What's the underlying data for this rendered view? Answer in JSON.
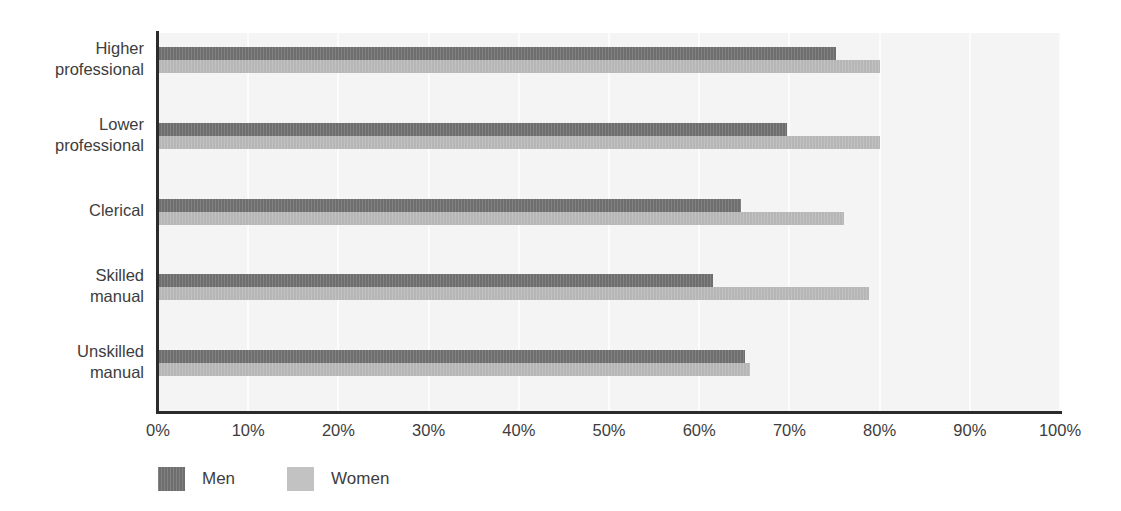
{
  "chart_data": {
    "type": "bar",
    "orientation": "horizontal",
    "title": "",
    "subtitle": "",
    "xlabel": "",
    "ylabel": "",
    "categories": [
      "Higher\nprofessional",
      "Lower\nprofessional",
      "Clerical",
      "Skilled\nmanual",
      "Unskilled\nmanual"
    ],
    "series": [
      {
        "name": "Men",
        "color": "#6e6e6e",
        "values": [
          75.2,
          69.7,
          64.6,
          61.5,
          65.1
        ]
      },
      {
        "name": "Women",
        "color": "#b6b6b6",
        "values": [
          80.0,
          80.0,
          76.0,
          78.8,
          65.6
        ]
      }
    ],
    "xlim": [
      0,
      100
    ],
    "xticks": [
      0,
      10,
      20,
      30,
      40,
      50,
      60,
      70,
      80,
      90,
      100
    ],
    "xtick_labels": [
      "0%",
      "10%",
      "20%",
      "30%",
      "40%",
      "50%",
      "60%",
      "70%",
      "80%",
      "90%",
      "100%"
    ],
    "grid": true,
    "grid_axis": "x",
    "legend_position": "bottom-left",
    "legend_entries": [
      "Men",
      "Women"
    ],
    "plot_background": "#f4f4f4",
    "axis_color": "#2b2b2b",
    "gridline_color": "#fcfcfc"
  }
}
